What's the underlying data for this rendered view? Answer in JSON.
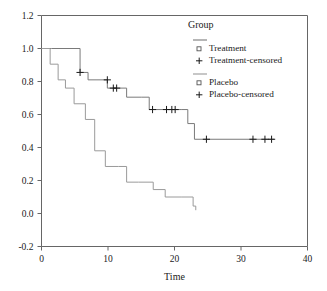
{
  "chart_data": {
    "type": "line",
    "title": "",
    "xlabel": "Time",
    "ylabel": "",
    "xlim": [
      0,
      40
    ],
    "ylim": [
      -0.2,
      1.2
    ],
    "xticks": [
      0,
      10,
      20,
      30,
      40
    ],
    "xtick_labels": [
      "0",
      "10",
      "20",
      "30",
      "40"
    ],
    "yticks": [
      -0.2,
      0.0,
      0.2,
      0.4,
      0.6,
      0.8,
      1.0,
      1.2
    ],
    "ytick_labels": [
      "-0.2",
      "0.0",
      "0.2",
      "0.4",
      "0.6",
      "0.8",
      "1.0",
      "1.2"
    ],
    "grid": false,
    "legend_position": "top-right",
    "legend_title": "Group",
    "step_style": "post",
    "series": [
      {
        "name": "Treatment",
        "color": "#7a7a7a",
        "censored_name": "Treatment-censored",
        "x": [
          0,
          1.5,
          5.8,
          7.0,
          8.2,
          9.9,
          11.0,
          12.8,
          15.0,
          16.2,
          21.0,
          22.0,
          23.0,
          35.0
        ],
        "y": [
          1.0,
          1.0,
          0.855,
          0.81,
          0.81,
          0.76,
          0.76,
          0.705,
          0.705,
          0.63,
          0.63,
          0.545,
          0.45,
          0.45
        ],
        "censored_x": [
          5.8,
          9.9,
          10.8,
          11.3,
          16.7,
          18.8,
          19.6,
          20.1,
          24.8,
          31.8,
          33.6,
          34.6
        ],
        "censored_y": [
          0.855,
          0.81,
          0.76,
          0.76,
          0.63,
          0.63,
          0.63,
          0.63,
          0.45,
          0.45,
          0.45,
          0.45
        ]
      },
      {
        "name": "Placebo",
        "color": "#9a9a9a",
        "censored_name": "Placebo-censored",
        "x": [
          0,
          1.3,
          2.5,
          3.6,
          4.9,
          6.6,
          8.0,
          9.6,
          11.6,
          12.8,
          14.6,
          16.8,
          18.6,
          21.0,
          22.8,
          23.2
        ],
        "y": [
          1.0,
          0.905,
          0.81,
          0.76,
          0.665,
          0.57,
          0.38,
          0.285,
          0.285,
          0.19,
          0.19,
          0.145,
          0.1,
          0.1,
          0.045,
          0.02
        ],
        "censored_x": [],
        "censored_y": []
      }
    ],
    "legend_entries": [
      {
        "marker": "line",
        "label": ""
      },
      {
        "marker": "square",
        "label": "Treatment"
      },
      {
        "marker": "plus",
        "label": "Treatment-censored"
      },
      {
        "marker": "line",
        "label": ""
      },
      {
        "marker": "square",
        "label": "Placebo"
      },
      {
        "marker": "plus",
        "label": "Placebo-censored"
      }
    ]
  },
  "figure": {
    "background_color": "#ffffff",
    "axis_color": "#666666",
    "text_color": "#1a1a1a"
  }
}
